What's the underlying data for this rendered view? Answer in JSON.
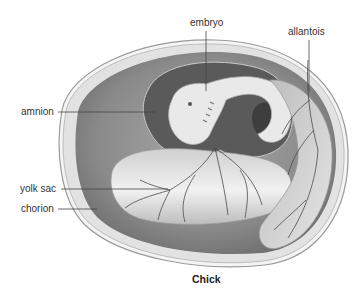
{
  "diagram": {
    "caption": "Chick",
    "labels": {
      "embryo": "embryo",
      "allantois": "allantois",
      "amnion": "amnion",
      "yolk_sac": "yolk sac",
      "chorion": "chorion"
    },
    "colors": {
      "shell_outline": "#9a9a9a",
      "chorion_fill": "#e2e2e2",
      "cavity_fill": "#8c8c8c",
      "amnion_fill": "#5a5a5a",
      "embryo_fill": "#e9e9e9",
      "yolk_fill": "#dcdcdc",
      "vessel": "#4a4a4a",
      "leader_line": "#444444"
    }
  }
}
